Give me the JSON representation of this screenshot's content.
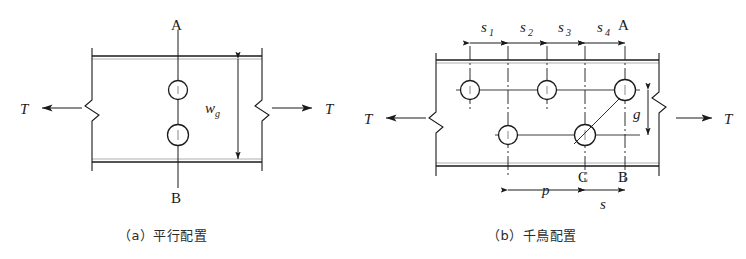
{
  "figure": {
    "panels": [
      {
        "id": "a",
        "caption": "（a）平行配置",
        "axis_labels": {
          "top": "A",
          "bottom": "B"
        },
        "force_labels": {
          "left": "T",
          "right": "T"
        },
        "dimensions": [
          {
            "name": "w_g",
            "symbol": "w",
            "subscript": "g",
            "orientation": "vertical"
          }
        ],
        "holes": [
          {
            "row": "upper",
            "index": 1
          },
          {
            "row": "lower",
            "index": 1
          }
        ]
      },
      {
        "id": "b",
        "caption": "（b）千鳥配置",
        "axis_labels": {
          "top": "A",
          "bottom_right": "B",
          "bottom_mid": "C"
        },
        "force_labels": {
          "left": "T",
          "right": "T"
        },
        "dimensions": [
          {
            "name": "s_1",
            "symbol": "s",
            "subscript": "1",
            "orientation": "horizontal"
          },
          {
            "name": "s_2",
            "symbol": "s",
            "subscript": "2",
            "orientation": "horizontal"
          },
          {
            "name": "s_3",
            "symbol": "s",
            "subscript": "3",
            "orientation": "horizontal"
          },
          {
            "name": "s_4",
            "symbol": "s",
            "subscript": "4",
            "orientation": "horizontal"
          },
          {
            "name": "g",
            "symbol": "g",
            "subscript": "",
            "orientation": "vertical"
          },
          {
            "name": "p",
            "symbol": "p",
            "subscript": "",
            "orientation": "horizontal"
          },
          {
            "name": "s",
            "symbol": "s",
            "subscript": "",
            "orientation": "horizontal"
          }
        ],
        "holes": [
          {
            "row": "upper",
            "index": 1
          },
          {
            "row": "upper",
            "index": 2
          },
          {
            "row": "upper",
            "index": 3
          },
          {
            "row": "lower",
            "index": 1
          },
          {
            "row": "lower",
            "index": 2
          }
        ]
      }
    ],
    "labels": {
      "T": "T",
      "A": "A",
      "B": "B",
      "C": "C",
      "w": "w",
      "g_sub": "g",
      "g": "g",
      "p": "p",
      "s": "s",
      "s1_sym": "s",
      "s1_sub": "1",
      "s2_sym": "s",
      "s2_sub": "2",
      "s3_sym": "s",
      "s3_sub": "3",
      "s4_sym": "s",
      "s4_sub": "4"
    },
    "colors": {
      "line": "#1a1a1a",
      "background": "#ffffff",
      "text": "#1a1a1a",
      "caption": "#2b2b2b"
    }
  }
}
